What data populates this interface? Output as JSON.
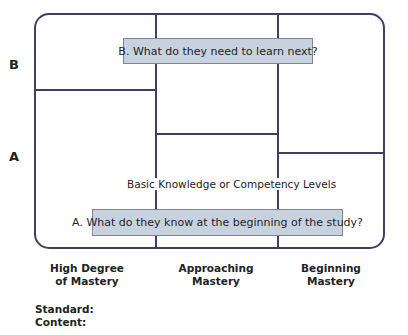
{
  "diagram": {
    "row_labels": {
      "b": "B",
      "a": "A"
    },
    "questions": {
      "b": "B. What do they need to learn next?",
      "a": "A. What do they know at the beginning of the study?"
    },
    "axis_caption": "Basic Knowledge or Competency Levels",
    "columns": [
      {
        "line1": "High Degree",
        "line2": "of Mastery"
      },
      {
        "line1": "Approaching",
        "line2": "Mastery"
      },
      {
        "line1": "Beginning",
        "line2": "Mastery"
      }
    ],
    "fields": {
      "standard": "Standard:",
      "content": "Content:"
    },
    "colors": {
      "line": "#3f3f63",
      "question_box_fill": "#c8d2de",
      "question_box_border": "#7a8696"
    }
  }
}
